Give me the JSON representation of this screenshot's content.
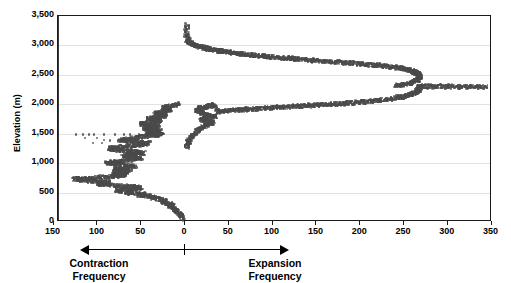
{
  "chart_data": {
    "type": "scatter",
    "title": "",
    "xlabel": "Contraction Frequency / Expansion Frequency",
    "ylabel": "Elevation (m)",
    "xlim": [
      -150,
      350
    ],
    "ylim": [
      0,
      3500
    ],
    "grid": true,
    "legend": false,
    "axis_note": "x-axis is bidirectional: values left of 0 are Contraction Frequency (scale 150 to 0), values right of 0 are Expansion Frequency (scale 0 to 350)",
    "x_ticks": [
      150,
      100,
      50,
      0,
      50,
      100,
      150,
      200,
      250,
      300,
      350
    ],
    "x_tick_labels": [
      "150",
      "100",
      "50",
      "0",
      "50",
      "100",
      "150",
      "200",
      "250",
      "300",
      "350"
    ],
    "y_ticks": [
      0,
      500,
      1000,
      1500,
      2000,
      2500,
      3000,
      3500
    ],
    "y_tick_labels": [
      "0",
      "500",
      "1,000",
      "1,500",
      "2,000",
      "2,500",
      "3,000",
      "3,500"
    ],
    "direction_labels": {
      "left_line1": "Contraction",
      "left_line2": "Frequency",
      "right_line1": "Expansion",
      "right_line2": "Frequency"
    },
    "marker_color": "#4a4a4a",
    "series": [
      {
        "name": "Expansion Frequency (upper branch)",
        "side": "expansion",
        "points": [
          [
            3,
            3350
          ],
          [
            2,
            3180
          ],
          [
            4,
            3100
          ],
          [
            3,
            3060
          ],
          [
            6,
            3040
          ],
          [
            9,
            3020
          ],
          [
            12,
            3000
          ],
          [
            16,
            2985
          ],
          [
            19,
            2970
          ],
          [
            23,
            2955
          ],
          [
            27,
            2942
          ],
          [
            31,
            2930
          ],
          [
            36,
            2918
          ],
          [
            40,
            2906
          ],
          [
            45,
            2895
          ],
          [
            50,
            2884
          ],
          [
            56,
            2873
          ],
          [
            61,
            2862
          ],
          [
            67,
            2852
          ],
          [
            73,
            2842
          ],
          [
            79,
            2832
          ],
          [
            85,
            2823
          ],
          [
            92,
            2813
          ],
          [
            98,
            2804
          ],
          [
            105,
            2795
          ],
          [
            112,
            2786
          ],
          [
            119,
            2777
          ],
          [
            126,
            2768
          ],
          [
            133,
            2760
          ],
          [
            141,
            2751
          ],
          [
            148,
            2743
          ],
          [
            156,
            2734
          ],
          [
            164,
            2726
          ],
          [
            172,
            2717
          ],
          [
            180,
            2709
          ],
          [
            188,
            2700
          ],
          [
            196,
            2691
          ],
          [
            204,
            2682
          ],
          [
            212,
            2673
          ],
          [
            219,
            2663
          ],
          [
            226,
            2653
          ],
          [
            233,
            2642
          ],
          [
            239,
            2630
          ],
          [
            245,
            2617
          ],
          [
            250,
            2603
          ],
          [
            254,
            2588
          ],
          [
            258,
            2572
          ],
          [
            261,
            2555
          ],
          [
            264,
            2537
          ],
          [
            266,
            2518
          ],
          [
            267,
            2498
          ],
          [
            268,
            2477
          ],
          [
            268,
            2455
          ],
          [
            267,
            2432
          ],
          [
            265,
            2409
          ],
          [
            262,
            2386
          ],
          [
            258,
            2363
          ],
          [
            253,
            2343
          ],
          [
            247,
            2327
          ],
          [
            240,
            2315
          ]
        ]
      },
      {
        "name": "Expansion Frequency (lower branch)",
        "side": "expansion",
        "points": [
          [
            2,
            1280
          ],
          [
            3,
            1340
          ],
          [
            5,
            1400
          ],
          [
            8,
            1460
          ],
          [
            12,
            1520
          ],
          [
            16,
            1570
          ],
          [
            20,
            1610
          ],
          [
            24,
            1645
          ],
          [
            28,
            1675
          ],
          [
            32,
            1700
          ],
          [
            22,
            1720
          ],
          [
            18,
            1745
          ],
          [
            26,
            1765
          ],
          [
            34,
            1785
          ],
          [
            30,
            1805
          ],
          [
            25,
            1828
          ],
          [
            20,
            1850
          ],
          [
            16,
            1875
          ],
          [
            14,
            1900
          ],
          [
            18,
            1925
          ],
          [
            23,
            1948
          ],
          [
            28,
            1968
          ],
          [
            33,
            1985
          ],
          [
            38,
            1870
          ],
          [
            44,
            1880
          ],
          [
            50,
            1890
          ],
          [
            57,
            1898
          ],
          [
            64,
            1906
          ],
          [
            71,
            1913
          ],
          [
            78,
            1920
          ],
          [
            85,
            1927
          ],
          [
            93,
            1934
          ],
          [
            100,
            1941
          ],
          [
            108,
            1948
          ],
          [
            115,
            1955
          ],
          [
            123,
            1962
          ],
          [
            131,
            1968
          ],
          [
            139,
            1975
          ],
          [
            147,
            1982
          ],
          [
            155,
            1989
          ],
          [
            163,
            1996
          ],
          [
            171,
            2004
          ],
          [
            179,
            2012
          ],
          [
            187,
            2021
          ],
          [
            195,
            2030
          ],
          [
            203,
            2040
          ],
          [
            211,
            2051
          ],
          [
            219,
            2063
          ],
          [
            227,
            2076
          ],
          [
            234,
            2090
          ],
          [
            241,
            2106
          ],
          [
            247,
            2124
          ],
          [
            253,
            2144
          ],
          [
            258,
            2166
          ],
          [
            262,
            2190
          ],
          [
            265,
            2216
          ],
          [
            267,
            2244
          ],
          [
            268,
            2272
          ],
          [
            267,
            2298
          ],
          [
            272,
            2305
          ],
          [
            280,
            2300
          ],
          [
            288,
            2303
          ],
          [
            297,
            2299
          ],
          [
            306,
            2302
          ],
          [
            316,
            2298
          ],
          [
            325,
            2301
          ],
          [
            334,
            2297
          ],
          [
            343,
            2300
          ]
        ]
      },
      {
        "name": "Contraction Frequency",
        "side": "contraction",
        "points": [
          [
            3,
            60
          ],
          [
            5,
            110
          ],
          [
            7,
            150
          ],
          [
            9,
            185
          ],
          [
            12,
            215
          ],
          [
            15,
            245
          ],
          [
            18,
            270
          ],
          [
            14,
            295
          ],
          [
            20,
            320
          ],
          [
            26,
            345
          ],
          [
            22,
            368
          ],
          [
            30,
            390
          ],
          [
            38,
            408
          ],
          [
            34,
            425
          ],
          [
            44,
            442
          ],
          [
            52,
            458
          ],
          [
            47,
            473
          ],
          [
            58,
            488
          ],
          [
            66,
            500
          ],
          [
            60,
            512
          ],
          [
            70,
            525
          ],
          [
            78,
            537
          ],
          [
            72,
            550
          ],
          [
            64,
            562
          ],
          [
            56,
            574
          ],
          [
            50,
            586
          ],
          [
            58,
            598
          ],
          [
            68,
            610
          ],
          [
            80,
            622
          ],
          [
            90,
            634
          ],
          [
            99,
            646
          ],
          [
            93,
            658
          ],
          [
            86,
            670
          ],
          [
            95,
            682
          ],
          [
            104,
            694
          ],
          [
            112,
            706
          ],
          [
            120,
            718
          ],
          [
            126,
            728
          ],
          [
            118,
            738
          ],
          [
            108,
            748
          ],
          [
            98,
            758
          ],
          [
            88,
            768
          ],
          [
            80,
            778
          ],
          [
            74,
            788
          ],
          [
            68,
            798
          ],
          [
            75,
            812
          ],
          [
            82,
            826
          ],
          [
            76,
            840
          ],
          [
            70,
            855
          ],
          [
            64,
            870
          ],
          [
            72,
            885
          ],
          [
            80,
            900
          ],
          [
            74,
            915
          ],
          [
            66,
            930
          ],
          [
            58,
            945
          ],
          [
            64,
            960
          ],
          [
            72,
            975
          ],
          [
            80,
            990
          ],
          [
            88,
            1005
          ],
          [
            82,
            1020
          ],
          [
            74,
            1035
          ],
          [
            66,
            1050
          ],
          [
            58,
            1065
          ],
          [
            50,
            1080
          ],
          [
            56,
            1095
          ],
          [
            63,
            1110
          ],
          [
            70,
            1125
          ],
          [
            64,
            1140
          ],
          [
            56,
            1155
          ],
          [
            48,
            1170
          ],
          [
            54,
            1185
          ],
          [
            62,
            1200
          ],
          [
            70,
            1215
          ],
          [
            78,
            1230
          ],
          [
            86,
            1245
          ],
          [
            80,
            1260
          ],
          [
            72,
            1275
          ],
          [
            64,
            1290
          ],
          [
            56,
            1305
          ],
          [
            48,
            1320
          ],
          [
            42,
            1335
          ],
          [
            50,
            1350
          ],
          [
            58,
            1365
          ],
          [
            66,
            1380
          ],
          [
            74,
            1395
          ],
          [
            68,
            1410
          ],
          [
            60,
            1425
          ],
          [
            52,
            1440
          ],
          [
            44,
            1455
          ],
          [
            38,
            1468
          ],
          [
            32,
            1480
          ],
          [
            26,
            1492
          ],
          [
            34,
            1505
          ],
          [
            42,
            1518
          ],
          [
            36,
            1530
          ],
          [
            28,
            1545
          ],
          [
            34,
            1560
          ],
          [
            40,
            1575
          ],
          [
            46,
            1590
          ],
          [
            38,
            1605
          ],
          [
            30,
            1620
          ],
          [
            36,
            1635
          ],
          [
            44,
            1650
          ],
          [
            50,
            1665
          ],
          [
            42,
            1680
          ],
          [
            34,
            1695
          ],
          [
            28,
            1712
          ],
          [
            34,
            1730
          ],
          [
            42,
            1748
          ],
          [
            36,
            1766
          ],
          [
            28,
            1784
          ],
          [
            22,
            1802
          ],
          [
            28,
            1820
          ],
          [
            34,
            1840
          ],
          [
            28,
            1860
          ],
          [
            22,
            1880
          ],
          [
            16,
            1900
          ],
          [
            20,
            1922
          ],
          [
            24,
            1944
          ],
          [
            18,
            1966
          ],
          [
            12,
            1988
          ],
          [
            8,
            2010
          ]
        ]
      },
      {
        "name": "Contraction Frequency (sparse outliers)",
        "side": "contraction",
        "points": [
          [
            124,
            1487
          ],
          [
            116,
            1487
          ],
          [
            110,
            1487
          ],
          [
            104,
            1487
          ],
          [
            92,
            1487
          ],
          [
            80,
            1487
          ],
          [
            70,
            1487
          ],
          [
            63,
            1487
          ],
          [
            52,
            1487
          ],
          [
            114,
            1420
          ],
          [
            100,
            1420
          ],
          [
            92,
            1400
          ],
          [
            86,
            1385
          ],
          [
            105,
            1345
          ],
          [
            95,
            1345
          ],
          [
            128,
            748
          ],
          [
            122,
            748
          ],
          [
            116,
            748
          ],
          [
            110,
            748
          ]
        ]
      }
    ]
  }
}
